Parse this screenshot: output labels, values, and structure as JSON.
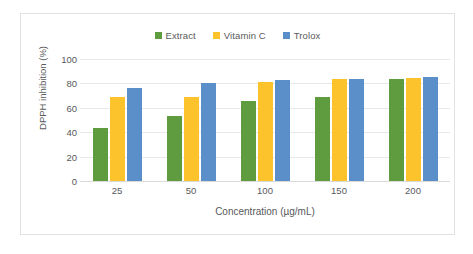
{
  "chart_data": {
    "type": "bar",
    "title": "",
    "categories": [
      "25",
      "50",
      "100",
      "150",
      "200"
    ],
    "series": [
      {
        "name": "Extract",
        "color": "#5f9c3f",
        "values": [
          43.5,
          53.0,
          65.5,
          69.0,
          84.0
        ]
      },
      {
        "name": "Vitamin C",
        "color": "#fcc32c",
        "values": [
          69.0,
          69.0,
          81.0,
          83.5,
          84.5
        ]
      },
      {
        "name": "Trolox",
        "color": "#5b8fc9",
        "values": [
          76.5,
          80.5,
          82.5,
          84.0,
          85.0
        ]
      }
    ],
    "xlabel": "Concentration (µg/mL)",
    "ylabel": "DPPH inhibition (%)",
    "ylim": [
      0,
      100
    ],
    "yticks": [
      "0",
      "20",
      "40",
      "60",
      "80",
      "100"
    ],
    "grid": true,
    "legend_position": "top-center"
  },
  "colors": {
    "extract": "#5f9c3f",
    "vitamin_c": "#fcc32c",
    "trolox": "#5b8fc9",
    "grid": "#e8e8e8",
    "text": "#58595b",
    "frame": "#e2e2e2",
    "background": "#ffffff"
  }
}
